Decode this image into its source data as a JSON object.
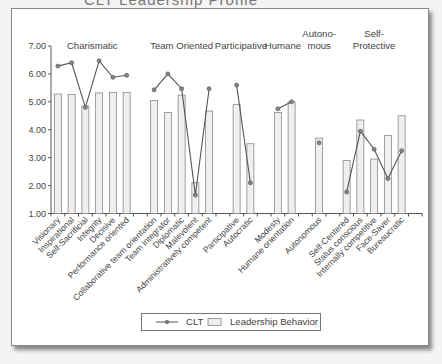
{
  "page": {
    "partial_title": "CLT Leadership Profile"
  },
  "chart_data": {
    "type": "bar",
    "title": "",
    "xlabel": "",
    "ylabel": "",
    "ylim": [
      1.0,
      7.0
    ],
    "yticks": [
      "1.00",
      "2.00",
      "3.00",
      "4.00",
      "5.00",
      "6.00",
      "7.00"
    ],
    "grid": false,
    "legend_position": "bottom",
    "groups": [
      {
        "label": "Charismatic",
        "label_lines": [
          "Charismatic"
        ]
      },
      {
        "label": "Team Oriented",
        "label_lines": [
          "Team Oriented"
        ]
      },
      {
        "label": "Participative",
        "label_lines": [
          "Participative"
        ]
      },
      {
        "label": "Humane",
        "label_lines": [
          "Humane"
        ]
      },
      {
        "label": "Autonomous",
        "label_lines": [
          "Autono-",
          "mous"
        ]
      },
      {
        "label": "Self-Protective",
        "label_lines": [
          "Self-",
          "Protective"
        ]
      }
    ],
    "categories": [
      "Visionary",
      "Inspirational",
      "Self-Sacrificial",
      "Integrity",
      "Decisive",
      "Performance oriented",
      "Collaborative team orientation",
      "Team integrator",
      "Diplomatic",
      "Malevolent",
      "Administratively competent",
      "Participative",
      "Autocratic",
      "Modesty",
      "Humane orientation",
      "Autonomous",
      "Self-Centered",
      "Status conscious",
      "Internally competitive",
      "Face-Saver",
      "Bureaucratic"
    ],
    "category_group": [
      0,
      0,
      0,
      0,
      0,
      0,
      1,
      1,
      1,
      1,
      1,
      2,
      2,
      3,
      3,
      4,
      5,
      5,
      5,
      5,
      5
    ],
    "series": [
      {
        "name": "CLT",
        "type": "line",
        "values": [
          6.28,
          6.4,
          4.8,
          6.47,
          5.88,
          5.95,
          5.43,
          6.0,
          5.47,
          1.66,
          5.47,
          5.6,
          2.1,
          4.75,
          5.0,
          3.53,
          1.77,
          3.95,
          3.3,
          2.25,
          3.25
        ]
      },
      {
        "name": "Leadership Behavior",
        "type": "bar",
        "values": [
          5.28,
          5.26,
          4.85,
          5.32,
          5.34,
          5.34,
          5.05,
          4.62,
          5.24,
          2.1,
          4.67,
          4.9,
          3.5,
          4.62,
          5.0,
          3.7,
          2.9,
          4.35,
          2.95,
          3.8,
          4.5
        ]
      }
    ]
  },
  "legend": {
    "items": [
      {
        "label": "CLT"
      },
      {
        "label": "Leadership Behavior"
      }
    ]
  }
}
